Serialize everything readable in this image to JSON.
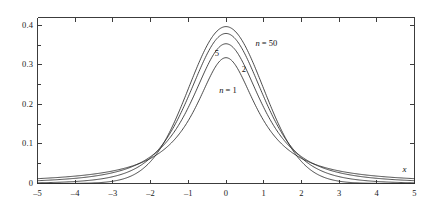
{
  "chart_data": {
    "type": "line",
    "title": "",
    "subtitle": "",
    "xlabel": "x",
    "ylabel": "",
    "xlim": [
      -5,
      5
    ],
    "ylim": [
      0,
      0.42
    ],
    "grid": false,
    "legend_position": "inline-annotations",
    "x_ticks": [
      -5,
      -4,
      -3,
      -2,
      -1,
      0,
      1,
      2,
      3,
      4,
      5
    ],
    "x_tick_labels": [
      "–5",
      "–4",
      "–3",
      "–2",
      "–1",
      "0",
      "1",
      "2",
      "3",
      "4",
      "5"
    ],
    "y_ticks": [
      0,
      0.1,
      0.2,
      0.3,
      0.4
    ],
    "y_tick_labels": [
      "0",
      "0.1",
      "0.2",
      "0.3",
      "0.4"
    ],
    "y_minor_ticks": [
      0.05,
      0.15,
      0.25,
      0.35
    ],
    "series": [
      {
        "name": "n = 1",
        "label": "n = 1",
        "peak_value": 0.318,
        "color": "#2b2b2b",
        "x": [
          -5,
          -4.5,
          -4,
          -3.5,
          -3,
          -2.5,
          -2,
          -1.75,
          -1.5,
          -1.25,
          -1,
          -0.75,
          -0.5,
          -0.25,
          0,
          0.25,
          0.5,
          0.75,
          1,
          1.25,
          1.5,
          1.75,
          2,
          2.5,
          3,
          3.5,
          4,
          4.5,
          5
        ],
        "values": [
          0.0122,
          0.015,
          0.0187,
          0.0241,
          0.0318,
          0.0439,
          0.0637,
          0.0787,
          0.0979,
          0.1221,
          0.1592,
          0.2037,
          0.2546,
          0.2994,
          0.3183,
          0.2994,
          0.2546,
          0.2037,
          0.1592,
          0.1221,
          0.0979,
          0.0787,
          0.0637,
          0.0439,
          0.0318,
          0.0241,
          0.0187,
          0.015,
          0.0122
        ]
      },
      {
        "name": "n = 2",
        "label": "2",
        "peak_value": 0.354,
        "color": "#2b2b2b",
        "x": [
          -5,
          -4.5,
          -4,
          -3.5,
          -3,
          -2.5,
          -2,
          -1.75,
          -1.5,
          -1.25,
          -1,
          -0.75,
          -0.5,
          -0.25,
          0,
          0.25,
          0.5,
          0.75,
          1,
          1.25,
          1.5,
          1.75,
          2,
          2.5,
          3,
          3.5,
          4,
          4.5,
          5
        ],
        "values": [
          0.0049,
          0.0066,
          0.0092,
          0.0132,
          0.0194,
          0.0295,
          0.0471,
          0.0606,
          0.0787,
          0.1024,
          0.1326,
          0.1693,
          0.2104,
          0.25,
          0.3536,
          0.25,
          0.2104,
          0.1693,
          0.1326,
          0.1024,
          0.0787,
          0.0606,
          0.0471,
          0.0295,
          0.0194,
          0.0132,
          0.0092,
          0.0066,
          0.0049
        ]
      },
      {
        "name": "n = 5",
        "label": "5",
        "peak_value": 0.38,
        "color": "#2b2b2b",
        "x": [
          -5,
          -4.5,
          -4,
          -3.5,
          -3,
          -2.5,
          -2,
          -1.75,
          -1.5,
          -1.25,
          -1,
          -0.75,
          -0.5,
          -0.25,
          0,
          0.25,
          0.5,
          0.75,
          1,
          1.25,
          1.5,
          1.75,
          2,
          2.5,
          3,
          3.5,
          4,
          4.5,
          5
        ],
        "values": [
          0.0017,
          0.0027,
          0.0051,
          0.0098,
          0.0173,
          0.0305,
          0.0651,
          0.0895,
          0.122,
          0.1626,
          0.2197,
          0.2734,
          0.3279,
          0.3632,
          0.3796,
          0.3632,
          0.3279,
          0.2734,
          0.2197,
          0.1626,
          0.122,
          0.0895,
          0.0651,
          0.0305,
          0.0173,
          0.0098,
          0.0051,
          0.0027,
          0.0017
        ]
      },
      {
        "name": "n = 50",
        "label": "n = 50",
        "peak_value": 0.398,
        "color": "#2b2b2b",
        "x": [
          -5,
          -4.5,
          -4,
          -3.5,
          -3,
          -2.5,
          -2,
          -1.75,
          -1.5,
          -1.25,
          -1,
          -0.75,
          -0.5,
          -0.25,
          0,
          0.25,
          0.5,
          0.75,
          1,
          1.25,
          1.5,
          1.75,
          2,
          2.5,
          3,
          3.5,
          4,
          4.5,
          5
        ],
        "values": [
          0.0003,
          0.0006,
          0.0013,
          0.0028,
          0.006,
          0.018,
          0.053,
          0.0862,
          0.129,
          0.182,
          0.24,
          0.298,
          0.349,
          0.383,
          0.397,
          0.383,
          0.349,
          0.298,
          0.24,
          0.182,
          0.129,
          0.0862,
          0.053,
          0.018,
          0.006,
          0.0028,
          0.0013,
          0.0006,
          0.0003
        ]
      }
    ],
    "annotations": [
      {
        "text": "n = 50",
        "x": 0.78,
        "y": 0.355,
        "italic_prefix": true
      },
      {
        "text": "5",
        "x": -0.3,
        "y": 0.328,
        "italic_prefix": false
      },
      {
        "text": "2",
        "x": 0.42,
        "y": 0.288,
        "italic_prefix": false
      },
      {
        "text": "n = 1",
        "x": -0.18,
        "y": 0.235,
        "italic_prefix": true
      }
    ]
  },
  "axes": {
    "x_axis_name": "x",
    "axis_color": "#3c3c3c",
    "curve_color": "#2b2b2b",
    "background": "#ffffff"
  }
}
